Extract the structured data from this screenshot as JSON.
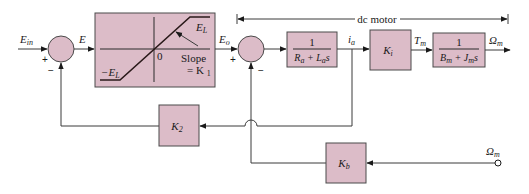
{
  "diagram": {
    "type": "control-block-diagram",
    "colors": {
      "block_fill": "#dcbcc8",
      "stroke": "#3a3a3a"
    },
    "bracket": {
      "label": "dc motor"
    },
    "signals": {
      "input": "E",
      "input_sub": "in",
      "error": "E",
      "limited": "E",
      "limited_sub": "o",
      "current": "i",
      "current_sub": "a",
      "torque": "T",
      "torque_sub": "m",
      "output": "Ω",
      "output_sub": "m",
      "feedback_input": "Ω",
      "feedback_input_sub": "m"
    },
    "summing_junctions": [
      {
        "id": "sum1",
        "plus": "+",
        "minus": "−"
      },
      {
        "id": "sum2",
        "plus": "+",
        "minus": "−"
      }
    ],
    "limiter": {
      "upper_label": "E",
      "upper_sub": "L",
      "lower_label": "−E",
      "lower_sub": "L",
      "origin_label": "0",
      "slope_label": "Slope",
      "slope_value": "= K",
      "slope_sub": "1"
    },
    "blocks": {
      "armature": {
        "numerator": "1",
        "den_a": "R",
        "den_a_sub": "a",
        "den_plus": " + ",
        "den_b": "L",
        "den_b_sub": "a",
        "den_s": "s"
      },
      "ki": {
        "label": "K",
        "sub": "i"
      },
      "mech": {
        "numerator": "1",
        "den_a": "B",
        "den_a_sub": "m",
        "den_plus": " + ",
        "den_b": "J",
        "den_b_sub": "m",
        "den_s": "s"
      },
      "k2": {
        "label": "K",
        "sub": "2"
      },
      "kb": {
        "label": "K",
        "sub": "b"
      }
    }
  }
}
